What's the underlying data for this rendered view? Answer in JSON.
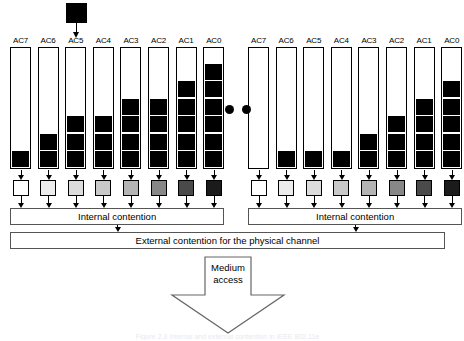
{
  "figure": {
    "caption": "Figure 2.3  Internal and external contention in IEEE 802.11e",
    "incoming_packet_label": "incoming-packet",
    "ellipsis": "•••"
  },
  "labels": {
    "ac": [
      "AC7",
      "AC6",
      "AC5",
      "AC4",
      "AC3",
      "AC2",
      "AC1",
      "AC0"
    ],
    "internal_contention": "Internal contention",
    "external_contention": "External contention for the physical channel",
    "medium_access_line1": "Medium",
    "medium_access_line2": "access"
  },
  "colors": {
    "queue_fill": "#000000",
    "outline": "#000000",
    "box_outline": "#555555",
    "background": "#ffffff",
    "backoff_shades": [
      "#ffffff",
      "#ececec",
      "#dcdcdc",
      "#c9c9c9",
      "#b4b4b4",
      "#878787",
      "#4a4a4a",
      "#1b1b1b"
    ]
  },
  "chart_data": {
    "type": "bar",
    "title": "Internal and external contention in IEEE 802.11e",
    "categories": [
      "AC7",
      "AC6",
      "AC5",
      "AC4",
      "AC3",
      "AC2",
      "AC1",
      "AC0"
    ],
    "series": [
      {
        "name": "Station 1 queued packets",
        "values": [
          1,
          2,
          3,
          3,
          4,
          4,
          5,
          6
        ]
      },
      {
        "name": "Station N queued packets",
        "values": [
          0,
          1,
          1,
          1,
          2,
          3,
          4,
          5
        ]
      }
    ],
    "ylabel": "Queued packets",
    "ylim": [
      0,
      8
    ],
    "grid": false,
    "legend": "none"
  },
  "stations": [
    {
      "id": "station-left",
      "queues": [
        {
          "ac": "AC7",
          "filled": 1
        },
        {
          "ac": "AC6",
          "filled": 2
        },
        {
          "ac": "AC5",
          "filled": 3
        },
        {
          "ac": "AC4",
          "filled": 3
        },
        {
          "ac": "AC3",
          "filled": 4
        },
        {
          "ac": "AC2",
          "filled": 4
        },
        {
          "ac": "AC1",
          "filled": 5
        },
        {
          "ac": "AC0",
          "filled": 6
        }
      ],
      "internal_contention": "Internal contention",
      "has_incoming_packet": true,
      "incoming_packet_target": "AC5"
    },
    {
      "id": "station-right",
      "queues": [
        {
          "ac": "AC7",
          "filled": 0
        },
        {
          "ac": "AC6",
          "filled": 1
        },
        {
          "ac": "AC5",
          "filled": 1
        },
        {
          "ac": "AC4",
          "filled": 1
        },
        {
          "ac": "AC3",
          "filled": 2
        },
        {
          "ac": "AC2",
          "filled": 3
        },
        {
          "ac": "AC1",
          "filled": 4
        },
        {
          "ac": "AC0",
          "filled": 5
        }
      ],
      "internal_contention": "Internal contention",
      "has_incoming_packet": false,
      "incoming_packet_target": null
    }
  ]
}
